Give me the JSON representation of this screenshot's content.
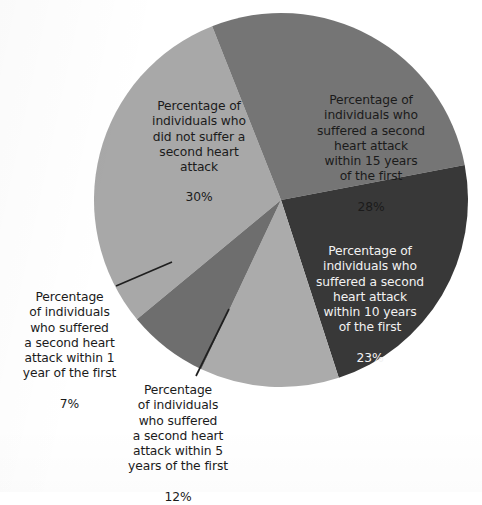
{
  "chart_data": {
    "type": "pie",
    "title": "",
    "subtitle": "",
    "xlabel": "",
    "ylabel": "",
    "legend_position": "none",
    "grid": false,
    "units": "percent",
    "total": 100,
    "categories": [
      "Percentage of individuals who did not suffer a second heart attack",
      "Percentage of individuals who suffered a second heart attack within 15 years of the first",
      "Percentage of individuals who suffered a second heart attack within 10 years of the first",
      "Percentage of individuals who suffered a second heart attack within 5 years of the first",
      "Percentage of individuals who suffered a second heart attack within 1 year of the first"
    ],
    "values": [
      30,
      28,
      23,
      12,
      7
    ],
    "slices": [
      {
        "id": "no-second-attack",
        "label": "Percentage of\nindividuals who\ndid not suffer a\nsecond heart\nattack",
        "value_text": "30%",
        "value": 30,
        "color": "#a8a8a8",
        "text_color": "#1b1b1b",
        "start_angle_deg": 230.4,
        "sweep_deg": 108.0,
        "leader_line": false
      },
      {
        "id": "within-15-years",
        "label": "Percentage of\nindividuals who\nsuffered a second\nheart attack\nwithin 15 years\nof the first",
        "value_text": "28%",
        "value": 28,
        "color": "#757575",
        "text_color": "#1b1b1b",
        "start_angle_deg": 338.4,
        "sweep_deg": 100.8,
        "leader_line": false
      },
      {
        "id": "within-10-years",
        "label": "Percentage of\nindividuals who\nsuffered a second\nheart attack\nwithin 10 years\nof the first",
        "value_text": "23%",
        "value": 23,
        "color": "#383838",
        "text_color": "#f2f2f2",
        "start_angle_deg": 79.2,
        "sweep_deg": 82.8,
        "leader_line": false
      },
      {
        "id": "within-5-years",
        "label": "Percentage\nof individuals\nwho suffered\na second heart\nattack within 5\nyears of the first",
        "value_text": "12%",
        "value": 12,
        "color": "#ababab",
        "text_color": "#1b1b1b",
        "start_angle_deg": 162.0,
        "sweep_deg": 43.2,
        "leader_line": true
      },
      {
        "id": "within-1-year",
        "label": "Percentage\nof individuals\nwho suffered\na second heart\nattack within 1\nyear of the first",
        "value_text": "7%",
        "value": 7,
        "color": "#6e6e6e",
        "text_color": "#1b1b1b",
        "start_angle_deg": 205.2,
        "sweep_deg": 25.2,
        "leader_line": true
      }
    ],
    "geometry": {
      "center_x": 281,
      "center_y": 200,
      "radius": 187
    },
    "colors": {
      "background": "#fdfdfd",
      "slice_light": "#a8a8a8",
      "slice_medium": "#757575",
      "slice_dark": "#383838",
      "slice_light_2": "#ababab",
      "slice_medium_dark": "#6e6e6e",
      "leader_line": "#1f1f1f"
    }
  }
}
